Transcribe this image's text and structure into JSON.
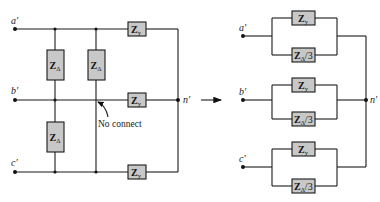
{
  "left_circuit": {
    "nodes": {
      "a": "a′",
      "b": "b′",
      "c": "c′",
      "n": "n′"
    },
    "delta_impedances": [
      {
        "main": "Z",
        "sub": "Δ"
      },
      {
        "main": "Z",
        "sub": "Δ"
      },
      {
        "main": "Z",
        "sub": "Δ"
      }
    ],
    "wye_impedances": [
      {
        "main": "Z",
        "sub": "y"
      },
      {
        "main": "Z",
        "sub": "y"
      },
      {
        "main": "Z",
        "sub": "y"
      }
    ],
    "annotation": "No connect"
  },
  "transform_arrow": "arrow-right",
  "right_circuit": {
    "nodes": {
      "a": "a′",
      "b": "b′",
      "c": "c′",
      "n": "n′"
    },
    "phases": [
      {
        "top": {
          "main": "Z",
          "sub": "y"
        },
        "bottom": {
          "main": "Z",
          "sub": "Δ",
          "suffix": "/3"
        }
      },
      {
        "top": {
          "main": "Z",
          "sub": "y"
        },
        "bottom": {
          "main": "Z",
          "sub": "Δ",
          "suffix": "/3"
        }
      },
      {
        "top": {
          "main": "Z",
          "sub": "y"
        },
        "bottom": {
          "main": "Z",
          "sub": "Δ",
          "suffix": "/3"
        }
      }
    ]
  }
}
